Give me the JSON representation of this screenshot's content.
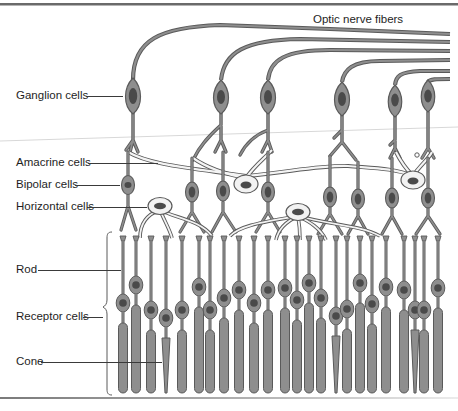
{
  "figure": {
    "colors": {
      "cell_fill": "#8e8e8e",
      "cell_outline": "#5a5a5a",
      "nucleus": "#4a4a4a",
      "pale_cell_fill": "#f2f2f2",
      "text": "#1e1e1e",
      "border": "#6a6a6a"
    }
  },
  "labels": {
    "optic_nerve_fibers": "Optic nerve fibers",
    "ganglion_cells": "Ganglion cells",
    "amacrine_cells": "Amacrine cells",
    "bipolar_cells": "Bipolar cells",
    "horizontal_cells": "Horizontal cells",
    "rod": "Rod",
    "receptor_cells": "Receptor cells",
    "cone": "Cone"
  }
}
